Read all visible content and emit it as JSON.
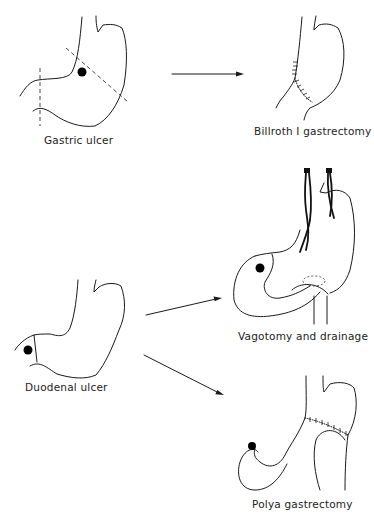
{
  "figure": {
    "panels": [
      {
        "id": "gastric-ulcer",
        "label": "Gastric ulcer"
      },
      {
        "id": "billroth",
        "label": "Billroth I gastrectomy"
      },
      {
        "id": "vagotomy",
        "label": "Vagotomy and drainage"
      },
      {
        "id": "duodenal-ulcer",
        "label": "Duodenal ulcer"
      },
      {
        "id": "polya",
        "label": "Polya gastrectomy"
      }
    ],
    "flows": [
      {
        "from": "Gastric ulcer",
        "to": "Billroth I gastrectomy"
      },
      {
        "from": "Duodenal ulcer",
        "to": "Vagotomy and drainage"
      },
      {
        "from": "Duodenal ulcer",
        "to": "Polya gastrectomy"
      }
    ],
    "colors": {
      "line": "#1a1a1a",
      "background": "#ffffff",
      "ulcer": "#000000"
    }
  }
}
